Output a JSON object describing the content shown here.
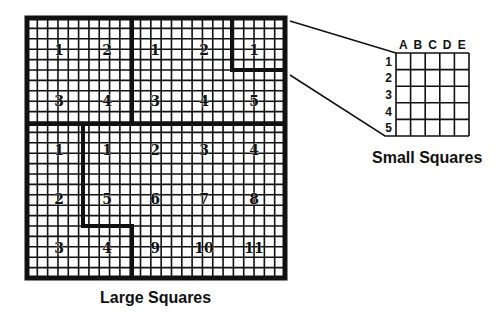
{
  "large_grid": {
    "x": 27,
    "y": 18,
    "width": 258,
    "height": 260,
    "cells": 25,
    "outer_border_width": 5,
    "thin_line_width": 1.6,
    "thick_line_width": 4,
    "caption": "Large Squares",
    "thick_segments": [
      {
        "x1": 132,
        "y1": 18,
        "x2": 132,
        "y2": 124
      },
      {
        "x1": 27,
        "y1": 124,
        "x2": 285,
        "y2": 124
      },
      {
        "x1": 232,
        "y1": 18,
        "x2": 232,
        "y2": 70
      },
      {
        "x1": 232,
        "y1": 70,
        "x2": 285,
        "y2": 70
      },
      {
        "x1": 83,
        "y1": 124,
        "x2": 83,
        "y2": 226
      },
      {
        "x1": 83,
        "y1": 226,
        "x2": 132,
        "y2": 226
      },
      {
        "x1": 132,
        "y1": 226,
        "x2": 132,
        "y2": 278
      }
    ],
    "labels": [
      {
        "text": "1",
        "x": 59,
        "y": 51
      },
      {
        "text": "2",
        "x": 107,
        "y": 51
      },
      {
        "text": "1",
        "x": 155,
        "y": 51
      },
      {
        "text": "2",
        "x": 204,
        "y": 51
      },
      {
        "text": "1",
        "x": 254,
        "y": 51
      },
      {
        "text": "3",
        "x": 59,
        "y": 102
      },
      {
        "text": "4",
        "x": 107,
        "y": 102
      },
      {
        "text": "3",
        "x": 155,
        "y": 102
      },
      {
        "text": "4",
        "x": 204,
        "y": 102
      },
      {
        "text": "5",
        "x": 254,
        "y": 102
      },
      {
        "text": "1",
        "x": 59,
        "y": 151
      },
      {
        "text": "1",
        "x": 107,
        "y": 151
      },
      {
        "text": "2",
        "x": 155,
        "y": 151
      },
      {
        "text": "3",
        "x": 204,
        "y": 151
      },
      {
        "text": "4",
        "x": 254,
        "y": 151
      },
      {
        "text": "2",
        "x": 59,
        "y": 200
      },
      {
        "text": "5",
        "x": 107,
        "y": 200
      },
      {
        "text": "6",
        "x": 155,
        "y": 200
      },
      {
        "text": "7",
        "x": 204,
        "y": 200
      },
      {
        "text": "8",
        "x": 254,
        "y": 200
      },
      {
        "text": "3",
        "x": 59,
        "y": 249
      },
      {
        "text": "4",
        "x": 107,
        "y": 249
      },
      {
        "text": "9",
        "x": 155,
        "y": 249
      },
      {
        "text": "10",
        "x": 204,
        "y": 249
      },
      {
        "text": "11",
        "x": 254,
        "y": 249
      }
    ]
  },
  "small_grid": {
    "x": 396,
    "y": 53,
    "width": 73,
    "height": 83,
    "cells": 5,
    "caption": "Small Squares",
    "column_headers": [
      "A",
      "B",
      "C",
      "D",
      "E"
    ],
    "row_headers": [
      "1",
      "2",
      "3",
      "4",
      "5"
    ]
  },
  "connectors": [
    {
      "points": [
        [
          290,
          21
        ],
        [
          396,
          53
        ]
      ]
    },
    {
      "points": [
        [
          290,
          75
        ],
        [
          385,
          136
        ],
        [
          396,
          136
        ]
      ]
    }
  ],
  "colors": {
    "ink": "#111111",
    "background": "#ffffff"
  }
}
